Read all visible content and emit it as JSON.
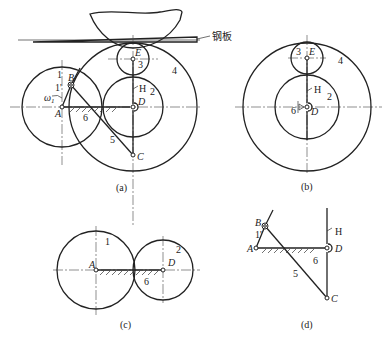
{
  "figure": {
    "panels": [
      {
        "id": "a",
        "caption": "(a)",
        "labels": {
          "steel_plate": "钢板",
          "link1": "1",
          "link1_prime": "1'",
          "omega": "ω",
          "omega_sub": "1",
          "point_A": "A",
          "point_B": "B",
          "point_C": "C",
          "point_D": "D",
          "point_E": "E",
          "H": "H",
          "gear2": "2",
          "gear3": "3",
          "gear4": "4",
          "link5": "5",
          "frame6": "6"
        }
      },
      {
        "id": "b",
        "caption": "(b)",
        "labels": {
          "gear3": "3",
          "point_E": "E",
          "gear4": "4",
          "H": "H",
          "gear2": "2",
          "frame6": "6",
          "point_D": "D"
        }
      },
      {
        "id": "c",
        "caption": "(c)",
        "labels": {
          "gear1": "1",
          "gear2": "2",
          "point_A": "A",
          "point_D": "D",
          "frame6": "6"
        }
      },
      {
        "id": "d",
        "caption": "(d)",
        "labels": {
          "point_B": "B",
          "link1_prime": "1'",
          "point_A": "A",
          "point_D": "D",
          "point_C": "C",
          "H": "H",
          "link5": "5",
          "frame6": "6"
        }
      }
    ]
  }
}
